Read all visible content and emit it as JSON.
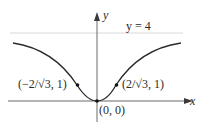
{
  "diagram": {
    "title": "",
    "axes": {
      "x_label": "x",
      "y_label": "y"
    },
    "asymptote": {
      "label": "y = 4",
      "y": 4,
      "color": "#d8d8d8"
    },
    "curve": {
      "description": "even function increasing from origin toward horizontal asymptote y = 4",
      "color": "#2a2a2a"
    },
    "points": [
      {
        "label": "(−2/√3, 1)",
        "x": -1.1547,
        "y": 1
      },
      {
        "label": "(2/√3, 1)",
        "x": 1.1547,
        "y": 1
      },
      {
        "label": "(0, 0)",
        "x": 0,
        "y": 0
      }
    ],
    "colors": {
      "axis": "#6a6a6a",
      "curve": "#2a2a2a",
      "asymptote": "#d8d8d8"
    }
  }
}
